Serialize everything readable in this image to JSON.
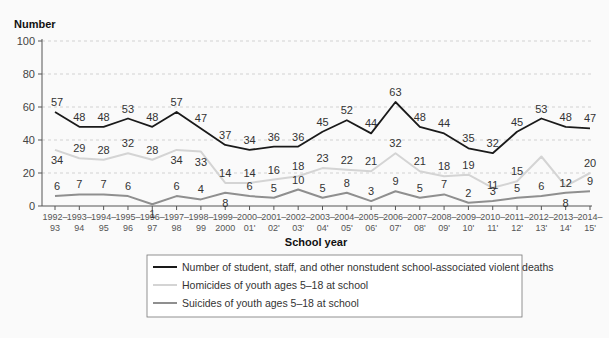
{
  "chart_data": {
    "type": "line",
    "title": "",
    "ylabel": "Number",
    "xlabel": "School year",
    "ylim": [
      0,
      100
    ],
    "yticks": [
      0,
      20,
      40,
      60,
      80,
      100
    ],
    "grid": "horizontal dashed",
    "legend_position": "bottom (boxed)",
    "categories": [
      "1992–93",
      "1993–94",
      "1994–95",
      "1995–96",
      "1996–97",
      "1997–98",
      "1998–99",
      "1999–2000",
      "2000–01'",
      "2001–02'",
      "2002–03'",
      "2003–04'",
      "2004–05'",
      "2005–06'",
      "2006–07'",
      "2007–08'",
      "2008–09'",
      "2009–10'",
      "2010–11'",
      "2011–12'",
      "2012–13'",
      "2013–14'",
      "2014–15'"
    ],
    "tick_labels_top": [
      "1992–",
      "1993–",
      "1994–",
      "1995–",
      "1996–",
      "1997–",
      "1998–",
      "1999–",
      "2000–",
      "2001–",
      "2002–",
      "2003–",
      "2004–",
      "2005–",
      "2006–",
      "2007–",
      "2008–",
      "2009–",
      "2010–",
      "2011–",
      "2012–",
      "2013–",
      "2014–"
    ],
    "tick_labels_bottom": [
      "93",
      "94",
      "95",
      "96",
      "97",
      "98",
      "99",
      "2000",
      "01'",
      "02'",
      "03'",
      "04'",
      "05'",
      "06'",
      "07'",
      "08'",
      "09'",
      "10'",
      "11'",
      "12'",
      "13'",
      "14'",
      "15'"
    ],
    "series": [
      {
        "name": "Number of student, staff, and other nonstudent school-associated violent deaths",
        "color": "#1a1a1a",
        "values": [
          57,
          48,
          48,
          53,
          48,
          57,
          47,
          37,
          34,
          36,
          36,
          45,
          52,
          44,
          63,
          48,
          44,
          35,
          32,
          45,
          53,
          48,
          47
        ],
        "labels": [
          "57",
          "48",
          "48",
          "53",
          "48",
          "57",
          "47",
          "37",
          "34",
          "36",
          "36",
          "45",
          "52",
          "44",
          "63",
          "48",
          "44",
          "35",
          "32",
          "45",
          "53",
          "48",
          "47"
        ]
      },
      {
        "name": "Homicides of youth ages 5–18 at school",
        "color": "#d4d4d4",
        "values": [
          34,
          29,
          28,
          32,
          28,
          34,
          33,
          14,
          14,
          16,
          18,
          23,
          22,
          21,
          32,
          21,
          18,
          19,
          11,
          15,
          30,
          12,
          20
        ],
        "labels": [
          "34",
          "29",
          "28",
          "32",
          "28",
          "34",
          "33",
          "14",
          "14",
          "16",
          "18",
          "23",
          "22",
          "21",
          "32",
          "21",
          "18",
          "19",
          "11",
          "15",
          "",
          "12",
          "20"
        ]
      },
      {
        "name": "Suicides of youth ages 5–18 at school",
        "color": "#8f8f8f",
        "values": [
          6,
          7,
          7,
          6,
          1,
          6,
          4,
          8,
          6,
          5,
          10,
          5,
          8,
          3,
          9,
          5,
          7,
          2,
          3,
          5,
          6,
          8,
          9
        ],
        "labels": [
          "6",
          "7",
          "7",
          "6",
          "1",
          "6",
          "4",
          "8",
          "6",
          "5",
          "10",
          "5",
          "8",
          "3",
          "9",
          "5",
          "7",
          "2",
          "3",
          "5",
          "6",
          "8",
          "9"
        ]
      }
    ]
  },
  "legend": {
    "items": [
      {
        "label": "Number of student, staff, and other nonstudent school-associated violent deaths",
        "color": "#1a1a1a"
      },
      {
        "label": "Homicides of youth ages 5–18 at school",
        "color": "#d4d4d4"
      },
      {
        "label": "Suicides of youth ages 5–18 at school",
        "color": "#8f8f8f"
      }
    ]
  }
}
